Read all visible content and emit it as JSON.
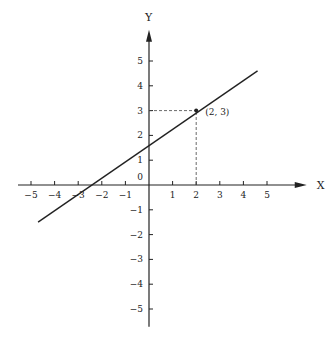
{
  "chart_data": {
    "type": "line",
    "title": "",
    "xlabel": "X",
    "ylabel": "Y",
    "xlim": [
      -5.8,
      6.6
    ],
    "ylim": [
      -5.8,
      6.1
    ],
    "grid": false,
    "x_ticks": [
      -5,
      -4,
      -3,
      -2,
      -1,
      1,
      2,
      3,
      4,
      5
    ],
    "y_ticks": [
      -5,
      -4,
      -3,
      -2,
      -1,
      1,
      2,
      3,
      4,
      5
    ],
    "x_tick_labels": [
      "−5",
      "−4",
      "−3",
      "−2",
      "−1",
      "1",
      "2",
      "3",
      "4",
      "5"
    ],
    "y_tick_labels": [
      "−5",
      "−4",
      "−3",
      "−2",
      "−1",
      "1",
      "2",
      "3",
      "4",
      "5"
    ],
    "origin_label": "0",
    "series": [
      {
        "name": "line",
        "x": [
          -4.7,
          4.6
        ],
        "y": [
          -1.5,
          4.6
        ]
      }
    ],
    "annotations": [
      {
        "type": "point",
        "x": 2,
        "y": 3,
        "label": "(2, 3)"
      },
      {
        "type": "dashed-guide",
        "from": [
          0,
          3
        ],
        "to": [
          2,
          3
        ]
      },
      {
        "type": "dashed-guide",
        "from": [
          2,
          0
        ],
        "to": [
          2,
          3
        ]
      }
    ]
  }
}
